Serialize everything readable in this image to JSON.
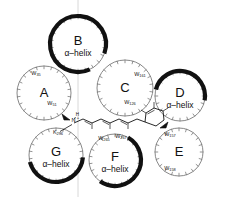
{
  "figure": {
    "background_color": "#ffffff",
    "ink_color": "#111111",
    "thin_color": "#7a7a7a",
    "guide_color": "#d8d8d8"
  },
  "helices": [
    {
      "id": "A",
      "label": "A",
      "sublabel": "",
      "cx": 44,
      "cy": 93,
      "r": 27,
      "ticks": 22,
      "thick_arc": null,
      "residues": [
        {
          "text": "W",
          "sub": "35",
          "x": 36,
          "y": 75
        },
        {
          "text": "W",
          "sub": "51",
          "x": 52,
          "y": 105
        }
      ]
    },
    {
      "id": "B",
      "label": "B",
      "sublabel": "α–helix",
      "cx": 78,
      "cy": 44,
      "r": 28,
      "ticks": 22,
      "thick_arc": {
        "start": -205,
        "end": 110
      },
      "residues": []
    },
    {
      "id": "C",
      "label": "C",
      "sublabel": "",
      "cx": 125,
      "cy": 88,
      "r": 28,
      "ticks": 22,
      "thick_arc": null,
      "residues": [
        {
          "text": "W",
          "sub": "161",
          "x": 140,
          "y": 76
        },
        {
          "text": "W",
          "sub": "126",
          "x": 130,
          "y": 104
        }
      ]
    },
    {
      "id": "D",
      "label": "D",
      "sublabel": "α–helix",
      "cx": 180,
      "cy": 96,
      "r": 25,
      "ticks": 20,
      "thick_arc": {
        "start": -75,
        "end": 100
      },
      "residues": []
    },
    {
      "id": "E",
      "label": "E",
      "sublabel": "",
      "cx": 179,
      "cy": 152,
      "r": 24,
      "ticks": 20,
      "thick_arc": null,
      "residues": [
        {
          "text": "W",
          "sub": "157",
          "x": 170,
          "y": 136
        },
        {
          "text": "W",
          "sub": "158",
          "x": 170,
          "y": 170
        }
      ]
    },
    {
      "id": "F",
      "label": "F",
      "sublabel": "α–helix",
      "cx": 115,
      "cy": 160,
      "r": 26,
      "ticks": 22,
      "thick_arc": {
        "start": 30,
        "end": 215
      },
      "residues": [
        {
          "text": "W",
          "sub": "265",
          "x": 104,
          "y": 140
        },
        {
          "text": "W",
          "sub": "267",
          "x": 121,
          "y": 138
        }
      ]
    },
    {
      "id": "G",
      "label": "G",
      "sublabel": "α–helix",
      "cx": 56,
      "cy": 155,
      "r": 27,
      "ticks": 22,
      "thick_arc": {
        "start": 95,
        "end": 255
      },
      "residues": [
        {
          "text": "K",
          "sub": "296",
          "x": 58,
          "y": 134
        }
      ]
    }
  ],
  "chromophore": {
    "name": "retinal",
    "schiff_base_label": "N",
    "schiff_base_charge": "+",
    "schiff_base_h": "H",
    "lysine_label": "K",
    "lysine_number": "296"
  },
  "guides": {
    "vertical_line_x": 78
  }
}
